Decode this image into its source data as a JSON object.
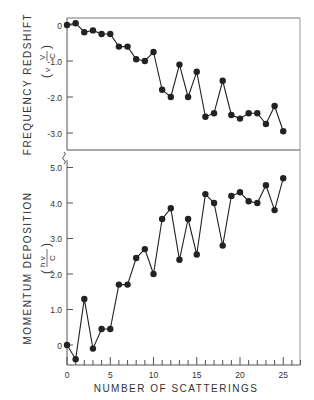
{
  "chart_data": [
    {
      "type": "line",
      "title": "",
      "xlabel": "",
      "ylabel": "FREQUENCY REDSHIFT",
      "ylabel_unit": "(ν0 VB / C)",
      "yticks": [
        "0",
        "-1.0",
        "-2.0",
        "-3.0"
      ],
      "ytick_values": [
        0,
        -1,
        -2,
        -3
      ],
      "ylim": [
        -3.45,
        0.2
      ],
      "xlim": [
        0,
        27
      ],
      "x": [
        0,
        1,
        2,
        3,
        4,
        5,
        6,
        7,
        8,
        9,
        10,
        11,
        12,
        13,
        14,
        15,
        16,
        17,
        18,
        19,
        20,
        21,
        22,
        23,
        24,
        25
      ],
      "series": [
        {
          "name": "Frequency redshift",
          "values": [
            0,
            0.05,
            -0.2,
            -0.15,
            -0.25,
            -0.25,
            -0.6,
            -0.6,
            -0.95,
            -1.0,
            -0.75,
            -1.8,
            -2.0,
            -1.1,
            -2.0,
            -1.3,
            -2.55,
            -2.45,
            -1.55,
            -2.5,
            -2.6,
            -2.45,
            -2.45,
            -2.75,
            -2.25,
            -2.95
          ]
        }
      ],
      "grid": false,
      "legend": "none"
    },
    {
      "type": "line",
      "title": "",
      "xlabel": "NUMBER OF SCATTERINGS",
      "ylabel": "MOMENTUM DEPOSITION",
      "ylabel_unit": "(h ν0 / C)",
      "xticks": [
        "0",
        "5",
        "10",
        "15",
        "20",
        "25"
      ],
      "yticks": [
        "0",
        "1.0",
        "2.0",
        "3.0",
        "4.0",
        "5.0"
      ],
      "ytick_values": [
        0,
        1,
        2,
        3,
        4,
        5
      ],
      "ylim": [
        -0.55,
        5.1
      ],
      "xlim": [
        0,
        27
      ],
      "x": [
        0,
        1,
        2,
        3,
        4,
        5,
        6,
        7,
        8,
        9,
        10,
        11,
        12,
        13,
        14,
        15,
        16,
        17,
        18,
        19,
        20,
        21,
        22,
        23,
        24,
        25
      ],
      "series": [
        {
          "name": "Momentum deposition",
          "values": [
            0,
            -0.4,
            1.3,
            -0.1,
            0.45,
            0.45,
            1.7,
            1.7,
            2.45,
            2.7,
            2.0,
            3.55,
            3.85,
            2.4,
            3.55,
            2.55,
            4.25,
            4.0,
            2.8,
            4.2,
            4.3,
            4.05,
            4.0,
            4.5,
            3.8,
            4.7
          ]
        }
      ],
      "grid": false,
      "legend": "none"
    }
  ],
  "labels": {
    "top_ylabel": "FREQUENCY REDSHIFT",
    "top_unit_left": "ν",
    "top_unit_num": "V",
    "top_unit_den": "C",
    "bottom_ylabel": "MOMENTUM DEPOSITION",
    "bottom_unit_num": "h ν",
    "bottom_unit_den": "C",
    "xlabel": "NUMBER OF SCATTERINGS"
  },
  "colors": {
    "ink": "#222222",
    "axis": "#555555",
    "background": "#ffffff"
  }
}
